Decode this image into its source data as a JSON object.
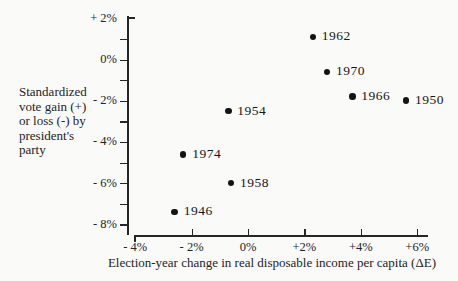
{
  "figure": {
    "ylabel_lines": [
      "Standardized",
      "vote gain (+)",
      "or loss (-) by",
      "president's",
      "party"
    ]
  },
  "chart_data": {
    "type": "scatter",
    "title": "",
    "xlabel": "Election-year change in real disposable income per capita (ΔE)",
    "ylabel": "Standardized vote gain (+) or loss (-) by president's party",
    "xlim": [
      -4,
      6
    ],
    "ylim": [
      -8.5,
      2
    ],
    "x_unit": "percent",
    "y_unit": "percent",
    "grid": false,
    "legend": "none",
    "x_ticks": [
      {
        "value": -4,
        "label": "- 4%"
      },
      {
        "value": -2,
        "label": "- 2%"
      },
      {
        "value": 0,
        "label": "0%"
      },
      {
        "value": 2,
        "label": "+2%"
      },
      {
        "value": 4,
        "label": "+4%"
      },
      {
        "value": 6,
        "label": "+6%"
      }
    ],
    "y_ticks": [
      {
        "value": 2,
        "label": "+ 2%"
      },
      {
        "value": 0,
        "label": "0%"
      },
      {
        "value": -2,
        "label": "- 2%"
      },
      {
        "value": -4,
        "label": "- 4%"
      },
      {
        "value": -6,
        "label": "- 6%"
      },
      {
        "value": -8,
        "label": "- 8%"
      }
    ],
    "y_minor_tick_values": [
      1,
      0,
      -1,
      -2,
      -3,
      -4,
      -5,
      -6,
      -7,
      -8
    ],
    "points": [
      {
        "label": "1962",
        "x": 2.3,
        "y": 1.1
      },
      {
        "label": "1970",
        "x": 2.8,
        "y": -0.6
      },
      {
        "label": "1966",
        "x": 3.7,
        "y": -1.8
      },
      {
        "label": "1950",
        "x": 5.6,
        "y": -2.0
      },
      {
        "label": "1954",
        "x": -0.7,
        "y": -2.5
      },
      {
        "label": "1974",
        "x": -2.3,
        "y": -4.6
      },
      {
        "label": "1958",
        "x": -0.6,
        "y": -6.0
      },
      {
        "label": "1946",
        "x": -2.6,
        "y": -7.4
      }
    ],
    "point_color": "#141414",
    "ink_color": "#262626"
  }
}
